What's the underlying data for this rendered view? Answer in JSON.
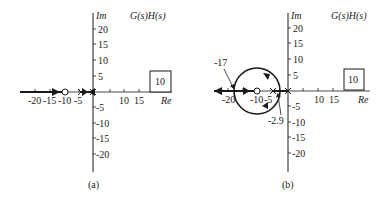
{
  "panels": [
    {
      "id": "a",
      "caption": "(a)",
      "title": "G(s)H(s)",
      "axis_im_label": "Im",
      "axis_re_label": "Re",
      "gain_box": "10",
      "re_ticks_neg": [
        "-20",
        "-15",
        "-10",
        "-5"
      ],
      "re_ticks_pos": [
        "10",
        "15"
      ],
      "im_ticks": [
        "20",
        "15",
        "10",
        "5",
        "-5",
        "-10",
        "-15",
        "-20"
      ],
      "zero": -10,
      "poles": [
        -4,
        0
      ],
      "description": "Root locus on real axis: branch from -infinity to zero at -10, and between poles at -4 and 0"
    },
    {
      "id": "b",
      "caption": "(b)",
      "title": "G(s)H(s)",
      "axis_im_label": "Im",
      "axis_re_label": "Re",
      "gain_box": "10",
      "re_ticks_neg": [
        "-20",
        "-10",
        "-5"
      ],
      "re_ticks_pos": [
        "10",
        "15"
      ],
      "im_ticks": [
        "20",
        "15",
        "10",
        "5",
        "-5",
        "-10",
        "-15",
        "-20"
      ],
      "zero": -10,
      "poles": [
        -5,
        0
      ],
      "breakaway_annotation": "-2.9",
      "breakin_annotation": "-17",
      "description": "Root locus with circular path centered at zero -10, breakaway at -2.9, break-in at -17"
    }
  ],
  "colors": {
    "line": "#1a1a1a",
    "text": "#222222",
    "background": "#ffffff"
  }
}
